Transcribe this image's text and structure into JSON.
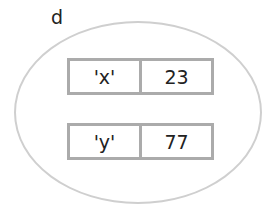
{
  "diagram": {
    "name": "d",
    "entries": [
      {
        "key": "'x'",
        "value": "23"
      },
      {
        "key": "'y'",
        "value": "77"
      }
    ]
  }
}
